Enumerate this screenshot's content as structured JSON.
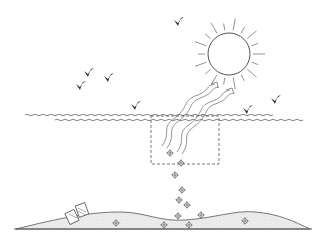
{
  "figure": {
    "title": "",
    "colors": {
      "line": "#555555",
      "bird": "#333333",
      "ground_fill": "#eeeeee",
      "background": "#ffffff"
    }
  },
  "elements": {
    "sun": {
      "cx": 229,
      "cy": 54,
      "r": 21,
      "ray_count": 18
    },
    "birds": [
      {
        "x": 178,
        "y": 22
      },
      {
        "x": 88,
        "y": 73
      },
      {
        "x": 108,
        "y": 78
      },
      {
        "x": 80,
        "y": 86
      },
      {
        "x": 135,
        "y": 106
      },
      {
        "x": 275,
        "y": 100
      },
      {
        "x": 247,
        "y": 110
      }
    ],
    "waves": [
      {
        "y": 115,
        "x1": 25,
        "x2": 270
      },
      {
        "y": 120,
        "x1": 55,
        "x2": 300
      }
    ],
    "dashed_box": {
      "x": 151,
      "y": 116,
      "w": 68,
      "h": 48
    },
    "arrows": [
      {
        "from": [
          165,
          146
        ],
        "to": [
          218,
          86
        ]
      },
      {
        "from": [
          180,
          152
        ],
        "to": [
          233,
          92
        ]
      }
    ],
    "particles": [
      {
        "x": 170,
        "y": 153
      },
      {
        "x": 181,
        "y": 163
      },
      {
        "x": 175,
        "y": 175
      },
      {
        "x": 182,
        "y": 190
      },
      {
        "x": 179,
        "y": 200
      },
      {
        "x": 187,
        "y": 205
      },
      {
        "x": 178,
        "y": 216
      },
      {
        "x": 201,
        "y": 215
      },
      {
        "x": 116,
        "y": 223
      },
      {
        "x": 164,
        "y": 225
      },
      {
        "x": 189,
        "y": 225
      },
      {
        "x": 245,
        "y": 221
      }
    ],
    "ground": {
      "x1": 16,
      "x2": 310,
      "base_y": 229
    },
    "debris": {
      "x": 75,
      "y": 213
    }
  }
}
